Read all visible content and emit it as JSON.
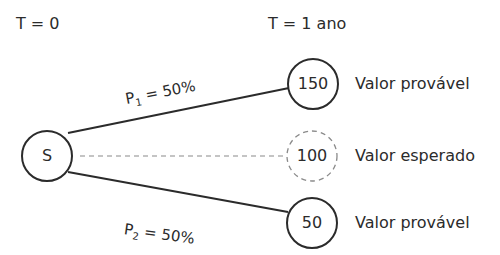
{
  "time_labels": {
    "start": "T = 0",
    "end": "T = 1 ano"
  },
  "root_node": {
    "label": "S"
  },
  "outcome_nodes": [
    {
      "value": "150",
      "caption": "Valor provável",
      "style": "solid"
    },
    {
      "value": "100",
      "caption": "Valor esperado",
      "style": "dashed"
    },
    {
      "value": "50",
      "caption": "Valor provável",
      "style": "solid"
    }
  ],
  "branches": [
    {
      "prob_symbol": "P",
      "prob_index": "1",
      "prob_rest": " = 50%"
    },
    {
      "prob_symbol": "P",
      "prob_index": "2",
      "prob_rest": " = 50%"
    }
  ],
  "colors": {
    "line": "#2b2b2b",
    "dashed": "#8a8a8a",
    "text": "#2b2b2b",
    "background": "#ffffff"
  }
}
